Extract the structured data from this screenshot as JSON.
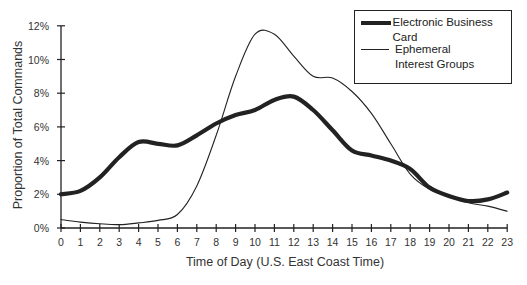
{
  "chart_data": {
    "type": "line",
    "title": "",
    "xlabel": "Time of Day (U.S. East Coast Time)",
    "ylabel": "Proportion of Total Commands",
    "x": [
      0,
      1,
      2,
      3,
      4,
      5,
      6,
      7,
      8,
      9,
      10,
      11,
      12,
      13,
      14,
      15,
      16,
      17,
      18,
      19,
      20,
      21,
      22,
      23
    ],
    "x_tick_labels": [
      "0",
      "1",
      "2",
      "3",
      "4",
      "5",
      "6",
      "7",
      "8",
      "9",
      "10",
      "11",
      "12",
      "13",
      "14",
      "15",
      "16",
      "17",
      "18",
      "19",
      "20",
      "21",
      "22",
      "23"
    ],
    "y_tick_labels": [
      "0%",
      "2%",
      "4%",
      "6%",
      "8%",
      "10%",
      "12%"
    ],
    "ylim": [
      0,
      12
    ],
    "xlim": [
      0,
      23
    ],
    "grid": false,
    "legend_position": "upper right",
    "series": [
      {
        "name": "Electronic Business Card",
        "style": "thick",
        "color": "#222222",
        "values": [
          2.0,
          2.2,
          3.0,
          4.2,
          5.1,
          5.0,
          4.9,
          5.5,
          6.2,
          6.7,
          7.0,
          7.6,
          7.8,
          7.0,
          5.8,
          4.6,
          4.3,
          4.0,
          3.5,
          2.4,
          1.9,
          1.6,
          1.7,
          2.1
        ]
      },
      {
        "name": "Ephemeral Interest Groups",
        "style": "thin",
        "color": "#222222",
        "values": [
          0.5,
          0.35,
          0.25,
          0.2,
          0.3,
          0.45,
          0.8,
          2.5,
          5.5,
          9.0,
          11.5,
          11.5,
          10.2,
          9.0,
          8.9,
          8.1,
          6.8,
          5.0,
          3.2,
          2.3,
          1.9,
          1.5,
          1.3,
          1.0
        ]
      }
    ]
  },
  "legend": {
    "items": [
      {
        "label": "Electronic Business Card"
      },
      {
        "label": "Ephemeral Interest Groups"
      }
    ]
  }
}
